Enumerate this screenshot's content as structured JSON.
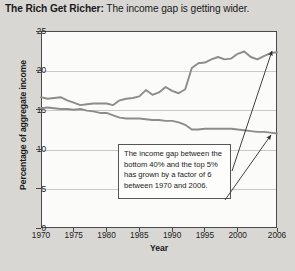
{
  "title": {
    "bold_part": "The Rich Get Richer:",
    "rest": " The income gap is getting wider."
  },
  "annotation": {
    "text": "The income gap between the bottom 40% and the top 5% has grown by a factor of 6 between 1970 and 2006."
  },
  "chart_data": {
    "type": "line",
    "title": "The Rich Get Richer: The income gap is getting wider.",
    "xlabel": "Year",
    "ylabel": "Percentage of aggregate income",
    "xlim": [
      1970,
      2006
    ],
    "ylim": [
      0,
      25
    ],
    "yticks": [
      0,
      5,
      10,
      15,
      20,
      25
    ],
    "xticks": [
      1970,
      1975,
      1980,
      1985,
      1990,
      1995,
      2000,
      2006
    ],
    "grid": "horizontal",
    "legend": "none",
    "annotations": [
      {
        "text": "The income gap between the bottom 40% and the top 5% has grown by a factor of 6 between 1970 and 2006.",
        "points_to": [
          "top-5-percent-2006",
          "bottom-40-percent-2006"
        ]
      }
    ],
    "x": [
      1970,
      1971,
      1972,
      1973,
      1974,
      1975,
      1976,
      1977,
      1978,
      1979,
      1980,
      1981,
      1982,
      1983,
      1984,
      1985,
      1986,
      1987,
      1988,
      1989,
      1990,
      1991,
      1992,
      1993,
      1994,
      1995,
      1996,
      1997,
      1998,
      1999,
      2000,
      2001,
      2002,
      2003,
      2004,
      2005,
      2006
    ],
    "series": [
      {
        "name": "Top 5%",
        "color": "#8c8c8c",
        "values": [
          16.6,
          16.4,
          16.5,
          16.6,
          16.2,
          15.9,
          15.6,
          15.7,
          15.8,
          15.8,
          15.8,
          15.6,
          16.2,
          16.4,
          16.5,
          16.7,
          17.5,
          16.9,
          17.2,
          17.9,
          17.4,
          17.1,
          17.6,
          20.3,
          20.9,
          21.0,
          21.4,
          21.7,
          21.4,
          21.5,
          22.1,
          22.4,
          21.7,
          21.4,
          21.8,
          22.2,
          22.3
        ]
      },
      {
        "name": "Bottom 40%",
        "color": "#8c8c8c",
        "values": [
          15.2,
          15.3,
          15.2,
          15.1,
          15.1,
          15.0,
          15.1,
          14.9,
          14.8,
          14.6,
          14.6,
          14.3,
          14.0,
          13.9,
          13.9,
          13.9,
          13.8,
          13.7,
          13.7,
          13.6,
          13.6,
          13.4,
          13.1,
          12.5,
          12.5,
          12.6,
          12.6,
          12.6,
          12.6,
          12.6,
          12.5,
          12.4,
          12.3,
          12.2,
          12.2,
          12.1,
          12.0
        ]
      }
    ]
  }
}
